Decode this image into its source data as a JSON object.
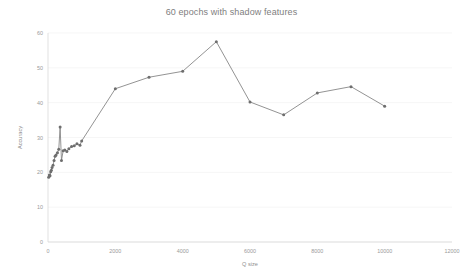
{
  "chart_data": {
    "type": "line",
    "title": "60 epochs with shadow features",
    "xlabel": "Q size",
    "ylabel": "Accuracy",
    "xlim": [
      0,
      12000
    ],
    "ylim": [
      0,
      60
    ],
    "xticks": [
      0,
      2000,
      4000,
      6000,
      8000,
      10000,
      12000
    ],
    "yticks": [
      0,
      10,
      20,
      30,
      40,
      50,
      60
    ],
    "xtick_labels": [
      "0",
      "2000",
      "4000",
      "6000",
      "8000",
      "10000",
      "12000"
    ],
    "ytick_labels": [
      "0",
      "10",
      "20",
      "30",
      "40",
      "50",
      "60"
    ],
    "grid": true,
    "grid_axis": "y",
    "legend": false,
    "marker": "circle",
    "line_color": "#808080",
    "marker_color": "#6e6e6e",
    "grid_color": "#f2f2f2",
    "axis_color": "#d9d9d9",
    "background": "#ffffff",
    "series": [
      {
        "name": "Accuracy",
        "x": [
          20,
          40,
          60,
          80,
          100,
          120,
          150,
          180,
          210,
          240,
          280,
          320,
          360,
          400,
          450,
          500,
          560,
          620,
          700,
          780,
          860,
          950,
          1000,
          2000,
          3000,
          4000,
          5000,
          6000,
          7000,
          8000,
          9000,
          10000
        ],
        "y": [
          18.6,
          19.2,
          19.0,
          20.2,
          20.6,
          21.4,
          22.0,
          23.4,
          24.6,
          25.0,
          25.6,
          26.6,
          33.0,
          23.4,
          26.2,
          26.4,
          26.0,
          26.8,
          27.4,
          27.6,
          28.2,
          27.8,
          29.0,
          44.0,
          47.3,
          49.0,
          57.5,
          40.2,
          36.5,
          42.8,
          44.6,
          39.0
        ]
      }
    ]
  }
}
